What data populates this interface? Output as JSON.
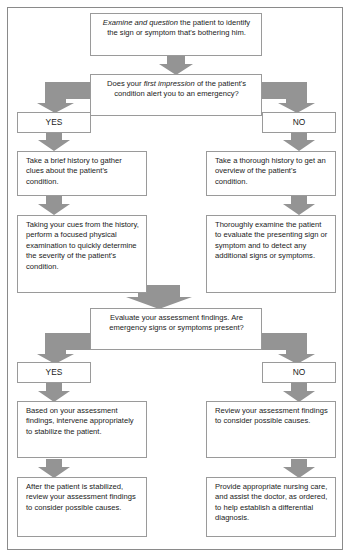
{
  "document": {
    "title": "Emergency assessment decision flowchart",
    "frame_border_color": "#8a8a8a",
    "box_border_color": "#9a9a9a",
    "arrow_color": "#949494",
    "background_color": "#ffffff",
    "text_color": "#1a1a1a"
  },
  "nodes": {
    "start": {
      "id": "examine-question",
      "text_italic_lead": "Examine and question",
      "text": "Examine and question the patient to identify the sign or symptom that's bothering him.",
      "text_rest": " the patient to identify the sign or symptom that's bothering him."
    },
    "decision1": {
      "id": "first-impression-decision",
      "text": "Does your first impression of the patient's condition alert you to an emergency?",
      "text_lead": "Does your ",
      "text_italic": "first impression",
      "text_rest": " of the patient's condition alert you to an emergency?"
    },
    "decision1_yes_label": "YES",
    "decision1_no_label": "NO",
    "yes_history": {
      "id": "brief-history",
      "text": "Take a brief history to gather clues about the patient's condition."
    },
    "no_history": {
      "id": "thorough-history",
      "text": "Take a thorough history to get an overview of the patient's condition."
    },
    "yes_exam": {
      "id": "focused-physical-exam",
      "text": "Taking your cues from the history, perform a focused physical examination to quickly determine the severity of the patient's condition."
    },
    "no_exam": {
      "id": "thorough-examination",
      "text": "Thoroughly examine the patient to evaluate the presenting sign or symptom and to detect any additional signs or symptoms."
    },
    "decision2": {
      "id": "evaluate-findings-decision",
      "text": "Evaluate your assessment findings. Are emergency signs or symptoms present?"
    },
    "decision2_yes_label": "YES",
    "decision2_no_label": "NO",
    "yes_intervene": {
      "id": "intervene-stabilize",
      "text": "Based on your assessment findings, intervene appropriately to stabilize the patient."
    },
    "no_review": {
      "id": "review-findings",
      "text": "Review your assessment findings to consider possible causes."
    },
    "yes_after": {
      "id": "after-stabilized-review",
      "text": "After the patient is stabilized, review your assessment findings to consider possible causes."
    },
    "no_provide": {
      "id": "provide-nursing-care",
      "text": "Provide appropriate nursing care, and assist the doctor, as ordered, to help establish a differential diagnosis."
    }
  },
  "connectors": [
    {
      "name": "start-to-decision1",
      "type": "down-arrow"
    },
    {
      "name": "decision1-to-yes",
      "type": "elbow-left-down-arrow"
    },
    {
      "name": "decision1-to-no",
      "type": "elbow-right-down-arrow"
    },
    {
      "name": "yes-to-brief-history",
      "type": "down-arrow"
    },
    {
      "name": "no-to-thorough-history",
      "type": "down-arrow"
    },
    {
      "name": "brief-history-to-focused-exam",
      "type": "down-arrow"
    },
    {
      "name": "thorough-history-to-thorough-exam",
      "type": "down-arrow"
    },
    {
      "name": "exams-to-decision2",
      "type": "down-arrow-wide"
    },
    {
      "name": "decision2-to-yes",
      "type": "elbow-left-down-arrow"
    },
    {
      "name": "decision2-to-no",
      "type": "elbow-right-down-arrow"
    },
    {
      "name": "yes-to-intervene",
      "type": "down-arrow"
    },
    {
      "name": "no-to-review",
      "type": "down-arrow"
    },
    {
      "name": "intervene-to-after",
      "type": "down-arrow"
    },
    {
      "name": "review-to-provide",
      "type": "down-arrow"
    }
  ]
}
